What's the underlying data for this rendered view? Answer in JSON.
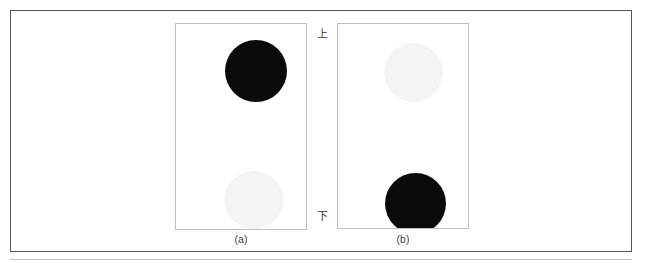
{
  "figure": {
    "orientation_markers": {
      "top_label": "上",
      "bottom_label": "下"
    },
    "panels": [
      {
        "id": "a",
        "caption": "(a)",
        "blobs": [
          {
            "position": "top",
            "fill": "#0b0b0b",
            "tone": "dark"
          },
          {
            "position": "bottom",
            "fill": "#f4f4f4",
            "tone": "light"
          }
        ]
      },
      {
        "id": "b",
        "caption": "(b)",
        "blobs": [
          {
            "position": "top",
            "fill": "#f4f4f4",
            "tone": "light"
          },
          {
            "position": "bottom",
            "fill": "#0b0b0b",
            "tone": "dark"
          }
        ]
      }
    ]
  },
  "colors": {
    "frame_border": "#555555",
    "panel_border": "#bfbfbf",
    "dark_blob": "#0b0b0b",
    "light_blob": "#f4f4f4",
    "text": "#3c3c3c",
    "page_background": "#ffffff"
  }
}
